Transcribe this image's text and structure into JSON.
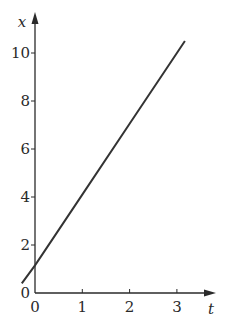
{
  "chart_data": {
    "type": "line",
    "title": "",
    "xlabel": "t",
    "ylabel": "x",
    "xlim": [
      0,
      3.5
    ],
    "ylim": [
      0,
      11
    ],
    "x_ticks": [
      0,
      1,
      2,
      3
    ],
    "y_ticks": [
      0,
      2,
      4,
      6,
      8,
      10
    ],
    "grid": false,
    "legend": null,
    "series": [
      {
        "name": "x(t)",
        "x": [
          -0.28,
          0,
          1,
          2,
          3,
          3.17
        ],
        "values": [
          0.4,
          1.15,
          4.1,
          7.05,
          10.0,
          10.5
        ]
      }
    ]
  },
  "colors": {
    "axis": "#2a2a2a",
    "line": "#333333",
    "background": "#ffffff"
  }
}
